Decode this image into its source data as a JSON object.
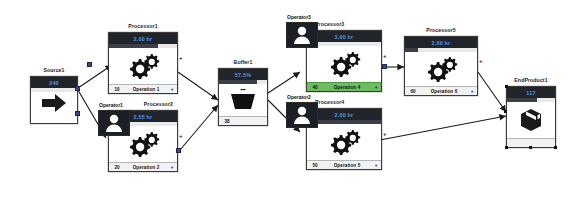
{
  "app": {
    "title": "Discrete Event Simulation Model"
  },
  "nodes": [
    {
      "id": "source1",
      "type": "source",
      "caption": "Source1",
      "title_value": "240",
      "progress": 0,
      "footer_left": "",
      "footer_center": "",
      "footer_plus": "",
      "icon": "arrow-right-icon"
    },
    {
      "id": "processor1",
      "type": "processor",
      "caption": "Processor1",
      "title_value": "2.00 hr",
      "progress": 72,
      "footer_left": "10",
      "footer_center": "Operation 1",
      "footer_plus": "+",
      "icon": "gears-icon",
      "highlight": false
    },
    {
      "id": "processor2",
      "type": "processor",
      "caption": "Processor2",
      "title_value": "2.55 hr",
      "progress": 0,
      "footer_left": "20",
      "footer_center": "Operation 2",
      "footer_plus": "+",
      "icon": "gears-icon",
      "highlight": false
    },
    {
      "id": "buffer1",
      "type": "buffer",
      "caption": "Buffer1",
      "title_value": "57.5%",
      "progress": 80,
      "footer_left": "38",
      "footer_center": "",
      "footer_plus": "",
      "icon": "basket-icon"
    },
    {
      "id": "processor3",
      "type": "processor",
      "caption": "Processor3",
      "title_value": "3.00 hr",
      "progress": 0,
      "footer_left": "40",
      "footer_center": "Operation 4",
      "footer_plus": "+",
      "icon": "gears-icon",
      "highlight": true
    },
    {
      "id": "processor4",
      "type": "processor",
      "caption": "Processor4",
      "title_value": "2.00 hr",
      "progress": 100,
      "footer_left": "50",
      "footer_center": "Operation 5",
      "footer_plus": "+",
      "icon": "gears-icon",
      "highlight": false
    },
    {
      "id": "processor5",
      "type": "processor",
      "caption": "Processor5",
      "title_value": "2.00 hr",
      "progress": 18,
      "footer_left": "60",
      "footer_center": "Operation 6",
      "footer_plus": "+",
      "icon": "gears-icon",
      "highlight": false
    },
    {
      "id": "endproduct1",
      "type": "sink",
      "caption": "EndProduct1",
      "title_value": "117",
      "progress": 62,
      "footer_left": "",
      "footer_center": "",
      "footer_plus": "",
      "icon": "box-icon"
    }
  ],
  "operators": [
    {
      "id": "operator1",
      "caption": "Operator1",
      "icon": "person-icon"
    },
    {
      "id": "operator2",
      "caption": "Operator2",
      "icon": "person-icon"
    },
    {
      "id": "operator3",
      "caption": "Operator3",
      "icon": "person-icon"
    }
  ],
  "colors": {
    "title_bar": "#21242b",
    "title_value": "#4f9ae8",
    "port": "#3b4a8c",
    "active_highlight": "#6cbd5e",
    "link": "#2b2b2b"
  }
}
